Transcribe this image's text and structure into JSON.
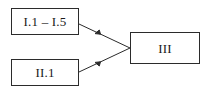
{
  "diagram": {
    "type": "flow-diagram",
    "background_color": "#ffffff",
    "line_color": "#2b2b2b",
    "text_color": "#1a1a1a",
    "nodes": [
      {
        "id": "group-i",
        "label": "I.1 – I.5",
        "shape": "rectangle"
      },
      {
        "id": "group-ii",
        "label": "II.1",
        "shape": "rectangle"
      },
      {
        "id": "group-iii",
        "label": "III",
        "shape": "rectangle"
      }
    ],
    "edges": [
      {
        "id": "edge-i-to-iii",
        "from": "group-i",
        "to": "group-iii",
        "style": "solid",
        "arrowhead": "mid-line-solid-triangle"
      },
      {
        "id": "edge-ii-to-iii",
        "from": "group-ii",
        "to": "group-iii",
        "style": "solid",
        "arrowhead": "mid-line-solid-triangle"
      }
    ]
  }
}
